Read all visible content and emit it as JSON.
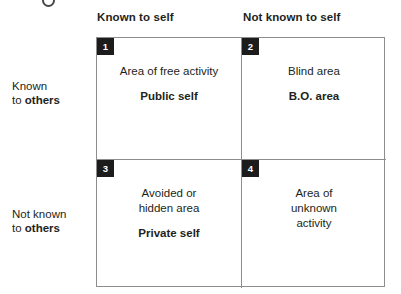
{
  "diagram": {
    "decoration": {
      "name": "cut-off-bullet-mark"
    },
    "column_headers": [
      {
        "label": "Known to self"
      },
      {
        "label": "Not known to self"
      }
    ],
    "row_labels": [
      {
        "line1": "Known",
        "line2_prefix": "to ",
        "line2_strong": "others"
      },
      {
        "line1": "Not known",
        "line2_prefix": "to ",
        "line2_strong": "others"
      }
    ],
    "quadrants": [
      {
        "number": "1",
        "description": "Area of free activity",
        "term": "Public self"
      },
      {
        "number": "2",
        "description": "Blind area",
        "term": "B.O. area"
      },
      {
        "number": "3",
        "description": "Avoided or\nhidden area",
        "term": "Private self"
      },
      {
        "number": "4",
        "description": "Area of\nunknown\nactivity",
        "term": ""
      }
    ],
    "colors": {
      "badge_background": "#1c1c1c",
      "badge_text": "#ffffff",
      "border": "#8d8d8d",
      "text": "#231f20",
      "background": "#ffffff"
    }
  }
}
